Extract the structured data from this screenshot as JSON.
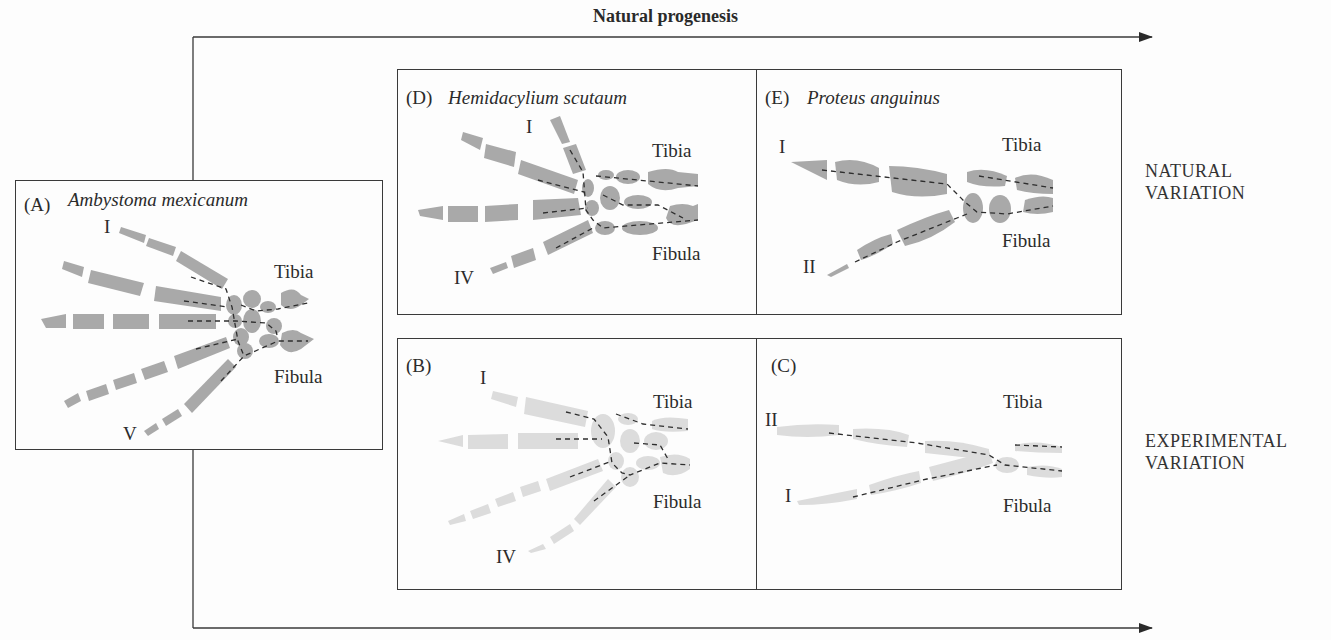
{
  "figure": {
    "title": "Natural progenesis",
    "row_labels": {
      "natural": [
        "NATURAL",
        "VARIATION"
      ],
      "experimental": [
        "EXPERIMENTAL",
        "VARIATION"
      ]
    },
    "panels": {
      "A": {
        "letter": "(A)",
        "species": "Ambystoma mexicanum",
        "digit_top": "I",
        "digit_bottom": "V",
        "tibia": "Tibia",
        "fibula": "Fibula"
      },
      "D": {
        "letter": "(D)",
        "species": "Hemidacylium scutaum",
        "digit_top": "I",
        "digit_bottom": "IV",
        "tibia": "Tibia",
        "fibula": "Fibula"
      },
      "E": {
        "letter": "(E)",
        "species": "Proteus anguinus",
        "digit_top": "I",
        "digit_bottom": "II",
        "tibia": "Tibia",
        "fibula": "Fibula"
      },
      "B": {
        "letter": "(B)",
        "species": "",
        "digit_top": "I",
        "digit_bottom": "IV",
        "tibia": "Tibia",
        "fibula": "Fibula"
      },
      "C": {
        "letter": "(C)",
        "species": "",
        "digit_top": "II",
        "digit_bottom": "I",
        "tibia": "Tibia",
        "fibula": "Fibula"
      }
    },
    "colors": {
      "bone_dark": "#a9a9a9",
      "bone_light": "#dcdcdc",
      "line": "#2e2e2e"
    }
  }
}
